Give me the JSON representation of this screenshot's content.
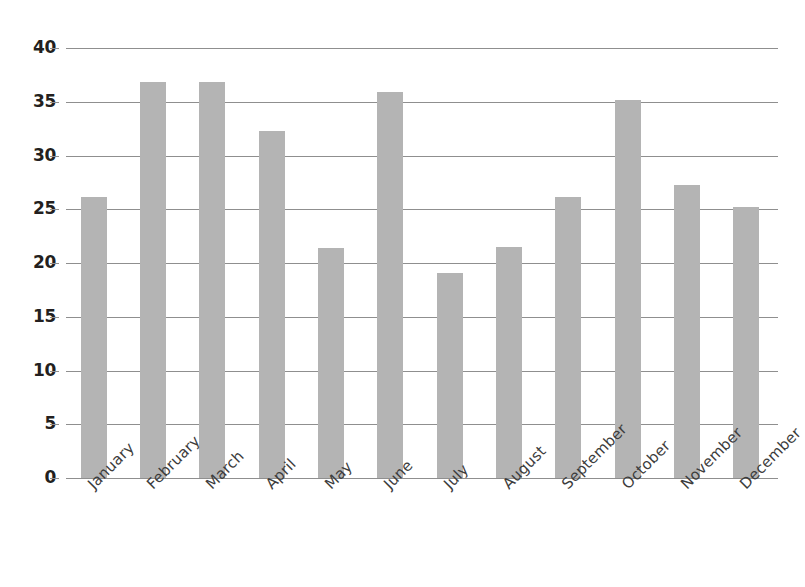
{
  "chart_data": {
    "type": "bar",
    "title": "",
    "subtitle": "",
    "xlabel": "",
    "ylabel": "",
    "categories": [
      "January",
      "February",
      "March",
      "April",
      "May",
      "June",
      "July",
      "August",
      "September",
      "October",
      "November",
      "December"
    ],
    "values": [
      26.1,
      36.8,
      36.8,
      32.3,
      21.4,
      35.9,
      19.1,
      21.5,
      26.1,
      35.2,
      27.3,
      25.2
    ],
    "ylim": [
      0,
      40
    ],
    "yticks": [
      0,
      5,
      10,
      15,
      20,
      25,
      30,
      35,
      40
    ],
    "ytick_labels": [
      "0",
      "5",
      "10",
      "15",
      "20",
      "25",
      "30",
      "35",
      "40"
    ],
    "grid": true,
    "legend": false,
    "legend_position": "none",
    "series": [
      {
        "name": "",
        "values": [
          26.1,
          36.8,
          36.8,
          32.3,
          21.4,
          35.9,
          19.1,
          21.5,
          26.1,
          35.2,
          27.3,
          25.2
        ]
      }
    ],
    "colors": {
      "bar": "#b4b4b4",
      "gridline": "#8f8f8f",
      "tick_label": "#231f20",
      "category_label": "#3c3c3c",
      "background": "#ffffff"
    },
    "xtick_label_rotation": -45
  },
  "artifact": {
    "top_text": ""
  }
}
